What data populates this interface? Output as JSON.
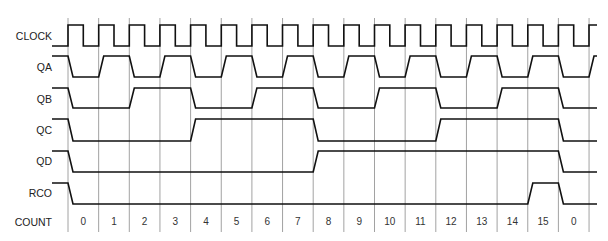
{
  "diagram": {
    "grid": {
      "x0": 68,
      "step": 30.65,
      "count": 18,
      "top": 18,
      "bottom": 232
    },
    "wave_start_x": 52,
    "wave_end_x": 597,
    "slant": 5,
    "colors": {
      "wave": "#111111",
      "grid": "#8a8a8a",
      "text": "#222222"
    }
  },
  "signals": [
    {
      "name": "CLOCK",
      "label_y": 36,
      "high_y": 25,
      "low_y": 46,
      "type": "clock"
    },
    {
      "name": "QA",
      "label_y": 67,
      "high_y": 56,
      "low_y": 77,
      "type": "data",
      "initial": 1,
      "values": [
        0,
        1,
        0,
        1,
        0,
        1,
        0,
        1,
        0,
        1,
        0,
        1,
        0,
        1,
        0,
        1,
        0,
        1
      ]
    },
    {
      "name": "QB",
      "label_y": 99,
      "high_y": 88,
      "low_y": 108,
      "type": "data",
      "initial": 1,
      "values": [
        0,
        0,
        1,
        1,
        0,
        0,
        1,
        1,
        0,
        0,
        1,
        1,
        0,
        0,
        1,
        1,
        0,
        0
      ]
    },
    {
      "name": "QC",
      "label_y": 130,
      "high_y": 119,
      "low_y": 141,
      "type": "data",
      "initial": 1,
      "values": [
        0,
        0,
        0,
        0,
        1,
        1,
        1,
        1,
        0,
        0,
        0,
        0,
        1,
        1,
        1,
        1,
        0,
        0
      ]
    },
    {
      "name": "QD",
      "label_y": 161,
      "high_y": 151,
      "low_y": 172,
      "type": "data",
      "initial": 1,
      "values": [
        0,
        0,
        0,
        0,
        0,
        0,
        0,
        0,
        1,
        1,
        1,
        1,
        1,
        1,
        1,
        1,
        0,
        0
      ]
    },
    {
      "name": "RCO",
      "label_y": 193,
      "high_y": 183,
      "low_y": 204,
      "type": "data",
      "initial": 1,
      "values": [
        0,
        0,
        0,
        0,
        0,
        0,
        0,
        0,
        0,
        0,
        0,
        0,
        0,
        0,
        0,
        1,
        0,
        0
      ]
    }
  ],
  "count_row": {
    "label": "COUNT",
    "label_y": 222,
    "values": [
      "0",
      "1",
      "2",
      "3",
      "4",
      "5",
      "6",
      "7",
      "8",
      "9",
      "10",
      "11",
      "12",
      "13",
      "14",
      "15",
      "0"
    ]
  }
}
